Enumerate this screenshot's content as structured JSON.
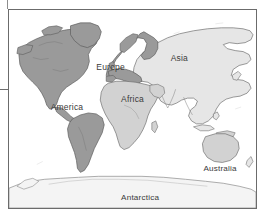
{
  "page": {
    "top_clip_text": ""
  },
  "map": {
    "name": "world-map",
    "background_color": "#ffffff",
    "border_color": "#6b6b6b",
    "frame": {
      "x": 8,
      "y": 9,
      "width": 249,
      "height": 200
    },
    "fills": {
      "dark_land": "#9a9a9a",
      "mid_land": "#d2d2d2",
      "light_land": "#e6e6e6",
      "pale_land": "#f4f4f4",
      "outline": "#6f6f6f",
      "ocean": "#ffffff"
    },
    "labels": [
      {
        "id": "label-america",
        "text": "America",
        "x": 42,
        "y": 101,
        "shade": "dark"
      },
      {
        "id": "label-europe",
        "text": "Europe",
        "x": 88,
        "y": 61,
        "shade": "dark"
      },
      {
        "id": "label-asia",
        "text": "Asia",
        "x": 163,
        "y": 52,
        "shade": "light"
      },
      {
        "id": "label-africa",
        "text": "Africa",
        "x": 113,
        "y": 93,
        "shade": "mid"
      },
      {
        "id": "label-australia",
        "text": "Australia",
        "x": 198,
        "y": 163,
        "shade": "mid"
      },
      {
        "id": "label-antarctica",
        "text": "Antarctica",
        "x": 116,
        "y": 199,
        "shade": "pale"
      }
    ],
    "regions": [
      {
        "id": "region-north-america",
        "name": "North America",
        "shade": "dark"
      },
      {
        "id": "region-south-america",
        "name": "South America",
        "shade": "dark"
      },
      {
        "id": "region-greenland",
        "name": "Greenland",
        "shade": "dark"
      },
      {
        "id": "region-europe",
        "name": "Europe",
        "shade": "dark"
      },
      {
        "id": "region-asia",
        "name": "Asia",
        "shade": "light"
      },
      {
        "id": "region-africa",
        "name": "Africa",
        "shade": "mid"
      },
      {
        "id": "region-australia",
        "name": "Australia",
        "shade": "mid"
      },
      {
        "id": "region-antarctica",
        "name": "Antarctica",
        "shade": "pale"
      }
    ]
  }
}
